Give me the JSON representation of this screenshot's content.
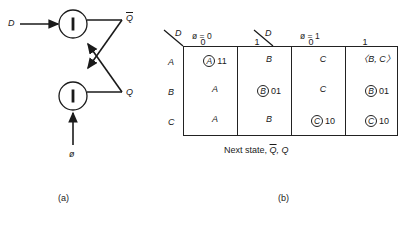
{
  "figure": {
    "panel_a": {
      "caption": "(a)",
      "inputs": [
        {
          "name": "D",
          "label": "D"
        },
        {
          "name": "phi",
          "label": "ø"
        }
      ],
      "outputs": [
        {
          "name": "Qbar",
          "label": "Q",
          "overbar": true
        },
        {
          "name": "Q",
          "label": "Q",
          "overbar": false
        }
      ],
      "gates": [
        {
          "name": "inverter-top",
          "symbol": "1"
        },
        {
          "name": "inverter-bottom",
          "symbol": "1"
        }
      ]
    },
    "panel_b": {
      "caption": "(b)",
      "table_caption_pre": "Next state, ",
      "table_caption_qbar": "Q",
      "table_caption_post": ", Q",
      "corner_label": "D",
      "group_headers": [
        {
          "label": "ø = 0"
        },
        {
          "label": "ø = 1"
        }
      ],
      "column_headers": [
        "0",
        "1",
        "0",
        "1"
      ],
      "row_headers": [
        "A",
        "B",
        "C"
      ],
      "rows": [
        {
          "header": "A",
          "cells": [
            {
              "state": "A",
              "circled": true,
              "bits": "11",
              "brackets": false
            },
            {
              "state": "B",
              "circled": false,
              "bits": "",
              "brackets": false
            },
            {
              "state": "C",
              "circled": false,
              "bits": "",
              "brackets": false
            },
            {
              "state": "B, C",
              "circled": false,
              "bits": "",
              "brackets": true
            }
          ]
        },
        {
          "header": "B",
          "cells": [
            {
              "state": "A",
              "circled": false,
              "bits": "",
              "brackets": false
            },
            {
              "state": "B",
              "circled": true,
              "bits": "01",
              "brackets": false
            },
            {
              "state": "C",
              "circled": false,
              "bits": "",
              "brackets": false
            },
            {
              "state": "B",
              "circled": true,
              "bits": "01",
              "brackets": false
            }
          ]
        },
        {
          "header": "C",
          "cells": [
            {
              "state": "A",
              "circled": false,
              "bits": "",
              "brackets": false
            },
            {
              "state": "B",
              "circled": false,
              "bits": "",
              "brackets": false
            },
            {
              "state": "C",
              "circled": true,
              "bits": "10",
              "brackets": false
            },
            {
              "state": "C",
              "circled": true,
              "bits": "10",
              "brackets": false
            }
          ]
        }
      ]
    }
  },
  "colors": {
    "ink": "#1a1a1a",
    "rule": "#222222",
    "background": "#ffffff"
  }
}
